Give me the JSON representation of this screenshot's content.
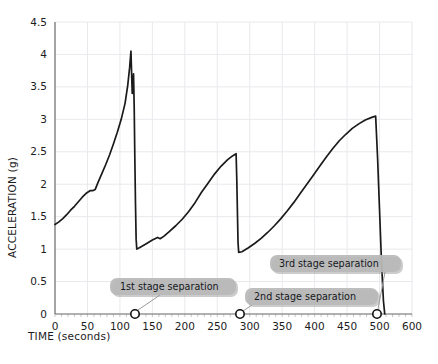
{
  "chart_data": {
    "type": "line",
    "title": "",
    "xlabel": "TIME (seconds)",
    "ylabel": "ACCELERATION (g)",
    "xlim": [
      0,
      600
    ],
    "ylim": [
      0,
      4.5
    ],
    "grid": true,
    "legend": "none",
    "xticks": [
      0,
      50,
      100,
      150,
      200,
      250,
      300,
      350,
      400,
      450,
      500,
      600
    ],
    "xtick_labels": [
      "0",
      "50",
      "100",
      "150",
      "200",
      "250",
      "300",
      "350",
      "400",
      "450",
      "500",
      "600"
    ],
    "yticks": [
      0,
      0.5,
      1,
      1.5,
      2,
      2.5,
      3,
      3.5,
      4,
      4.5
    ],
    "ytick_labels": [
      "0",
      "0.5",
      "1",
      "1.5",
      "2",
      "2.5",
      "3",
      "3.5",
      "4",
      "4.5"
    ],
    "series": [
      {
        "name": "acceleration",
        "color": "#1a1a1a",
        "points": [
          [
            0,
            1.38
          ],
          [
            6,
            1.42
          ],
          [
            12,
            1.47
          ],
          [
            18,
            1.53
          ],
          [
            24,
            1.6
          ],
          [
            30,
            1.66
          ],
          [
            36,
            1.73
          ],
          [
            42,
            1.8
          ],
          [
            48,
            1.86
          ],
          [
            54,
            1.9
          ],
          [
            58,
            1.9
          ],
          [
            62,
            1.92
          ],
          [
            66,
            2.02
          ],
          [
            72,
            2.16
          ],
          [
            78,
            2.3
          ],
          [
            84,
            2.45
          ],
          [
            90,
            2.62
          ],
          [
            96,
            2.8
          ],
          [
            102,
            3.0
          ],
          [
            108,
            3.25
          ],
          [
            112,
            3.52
          ],
          [
            115,
            3.8
          ],
          [
            117,
            4.05
          ],
          [
            118,
            3.72
          ],
          [
            119,
            3.4
          ],
          [
            120,
            3.52
          ],
          [
            121,
            3.7
          ],
          [
            122,
            3.2
          ],
          [
            123,
            2.4
          ],
          [
            124,
            1.7
          ],
          [
            125,
            1.15
          ],
          [
            126,
            1.0
          ],
          [
            130,
            1.02
          ],
          [
            140,
            1.08
          ],
          [
            150,
            1.14
          ],
          [
            158,
            1.18
          ],
          [
            162,
            1.16
          ],
          [
            168,
            1.2
          ],
          [
            176,
            1.27
          ],
          [
            186,
            1.36
          ],
          [
            196,
            1.46
          ],
          [
            206,
            1.58
          ],
          [
            216,
            1.72
          ],
          [
            226,
            1.88
          ],
          [
            236,
            2.02
          ],
          [
            246,
            2.16
          ],
          [
            256,
            2.28
          ],
          [
            266,
            2.38
          ],
          [
            274,
            2.44
          ],
          [
            279,
            2.47
          ],
          [
            280,
            2.1
          ],
          [
            281,
            1.6
          ],
          [
            282,
            1.1
          ],
          [
            283,
            0.95
          ],
          [
            288,
            0.96
          ],
          [
            298,
            1.02
          ],
          [
            308,
            1.09
          ],
          [
            318,
            1.17
          ],
          [
            328,
            1.26
          ],
          [
            338,
            1.36
          ],
          [
            348,
            1.47
          ],
          [
            358,
            1.59
          ],
          [
            368,
            1.72
          ],
          [
            378,
            1.86
          ],
          [
            388,
            2.0
          ],
          [
            398,
            2.14
          ],
          [
            408,
            2.28
          ],
          [
            418,
            2.42
          ],
          [
            428,
            2.55
          ],
          [
            438,
            2.67
          ],
          [
            448,
            2.77
          ],
          [
            458,
            2.86
          ],
          [
            468,
            2.93
          ],
          [
            478,
            2.99
          ],
          [
            488,
            3.03
          ],
          [
            494,
            3.05
          ],
          [
            497,
            2.4
          ],
          [
            500,
            1.6
          ],
          [
            503,
            0.8
          ],
          [
            506,
            0.2
          ],
          [
            508,
            0.0
          ]
        ]
      }
    ],
    "annotations": [
      {
        "id": "stage1",
        "label": "1st stage separation",
        "x": 118,
        "y": 0,
        "box_x": 110,
        "box_y": 278,
        "box_w": 126,
        "box_h": 17,
        "text_x": 120,
        "text_y": 290,
        "marker_px_x": 135,
        "marker_px_y": 314,
        "leader": "M 160 295 L 138 310"
      },
      {
        "id": "stage2",
        "label": "2nd stage separation",
        "x": 282,
        "y": 0,
        "box_x": 245,
        "box_y": 288,
        "box_w": 133,
        "box_h": 17,
        "text_x": 254,
        "text_y": 300,
        "marker_px_x": 240,
        "marker_px_y": 314,
        "leader": "M 252 305 L 243 311"
      },
      {
        "id": "stage3",
        "label": "3rd stage separation",
        "x": 508,
        "y": 0,
        "box_x": 270,
        "box_y": 255,
        "box_w": 131,
        "box_h": 17,
        "text_x": 279,
        "text_y": 267,
        "marker_px_x": 377,
        "marker_px_y": 314,
        "leader": "M 385 272 L 378 309"
      }
    ]
  }
}
